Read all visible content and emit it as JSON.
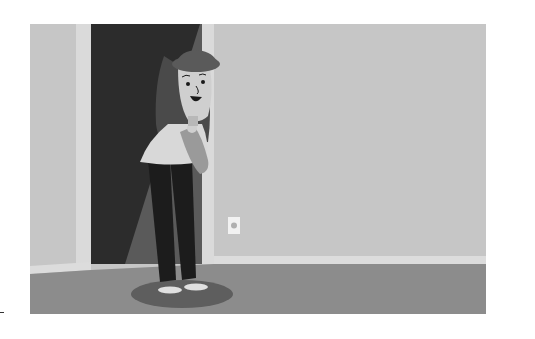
{
  "illustration": {
    "description": "Grayscale cartoon of a girl with long hair and a beret peeking from a dark doorway into a room with a wall outlet",
    "colors": {
      "wall": "#c6c6c6",
      "door_frame": "#dadada",
      "doorway": "#2c2c2c",
      "doorway_light": "#5a5a5a",
      "baseboard": "#dcdcdc",
      "floor": "#8c8c8c",
      "shadow": "#5e5e5e",
      "skin": "#cfcfcf",
      "hair": "#4a4a4a",
      "hat": "#5a5a5a",
      "shirt": "#d8d8d8",
      "pants": "#1c1c1c",
      "outlet": "#f2f2f2"
    },
    "objects": [
      "doorway",
      "girl",
      "wall-outlet",
      "baseboard",
      "floor",
      "shadow"
    ]
  }
}
